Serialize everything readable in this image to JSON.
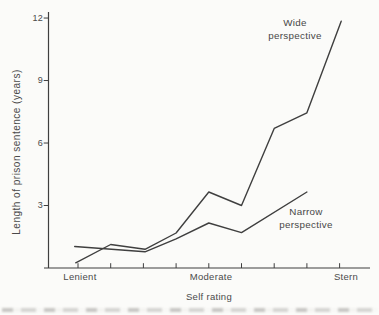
{
  "figure": {
    "background": "#fbfbf9",
    "ink_color": "#3f3f3f",
    "text_color": "#4a4a4a"
  },
  "chart_data": {
    "type": "line",
    "title": "",
    "xlabel": "Self rating",
    "ylabel": "Length of prison sentence (years)",
    "x_scale": {
      "min": 1,
      "max": 9,
      "tick_count": 9,
      "labeled_ticks": [
        {
          "pos": 1,
          "label": "Lenient"
        },
        {
          "pos": 5,
          "label": "Moderate"
        },
        {
          "pos": 9,
          "label": "Stern"
        }
      ]
    },
    "ylim": [
      0,
      12.5
    ],
    "yticks": [
      3,
      6,
      9,
      12
    ],
    "grid": false,
    "legend": "inline-annotations",
    "series": [
      {
        "name": "Wide perspective",
        "x": [
          0.93,
          2,
          3.05,
          4,
          5,
          6,
          7,
          8,
          9.05
        ],
        "y": [
          0.25,
          1.13,
          0.9,
          1.68,
          3.65,
          3.0,
          6.7,
          7.45,
          11.85
        ]
      },
      {
        "name": "Narrow perspective",
        "x": [
          0.9,
          3.05,
          4,
          5,
          6,
          8
        ],
        "y": [
          1.03,
          0.78,
          1.4,
          2.16,
          1.7,
          3.65
        ]
      }
    ]
  }
}
